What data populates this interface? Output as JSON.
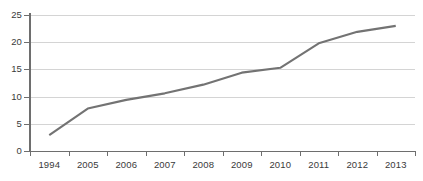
{
  "chart_data": {
    "type": "line",
    "title": "",
    "subtitle": "",
    "xlabel": "",
    "ylabel": "",
    "categories": [
      "1994",
      "2005",
      "2006",
      "2007",
      "2008",
      "2009",
      "2010",
      "2011",
      "2012",
      "2013"
    ],
    "values": [
      2.9,
      7.8,
      9.4,
      10.6,
      12.2,
      14.4,
      15.3,
      19.8,
      21.9,
      23.0
    ],
    "series": [
      {
        "name": "",
        "values": [
          2.9,
          7.8,
          9.4,
          10.6,
          12.2,
          14.4,
          15.3,
          19.8,
          21.9,
          23.0
        ]
      }
    ],
    "ylim": [
      0,
      25
    ],
    "yticks": [
      0,
      5,
      10,
      15,
      20,
      25
    ],
    "ytick_labels": [
      "0",
      "5",
      "10",
      "15",
      "20",
      "25"
    ],
    "xtick_labels": [
      "1994",
      "2005",
      "2006",
      "2007",
      "2008",
      "2009",
      "2010",
      "2011",
      "2012",
      "2013"
    ],
    "grid": true,
    "grid_axis": "y",
    "legend": false,
    "legend_position": "none",
    "annotations": [],
    "colors": {
      "line": "#737373",
      "gridline": "#d4d4d4",
      "axis": "#6e6e6e",
      "tick_text": "#3a3a3a",
      "background": "#ffffff"
    }
  }
}
